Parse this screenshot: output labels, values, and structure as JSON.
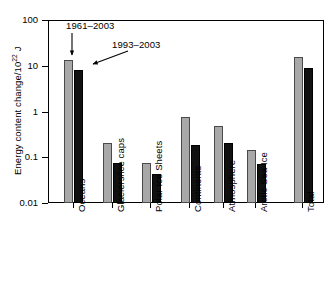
{
  "chart_data": {
    "type": "bar",
    "title": "",
    "xlabel": "",
    "ylabel": "Energy content change/10^22 J",
    "ylabel_parts": {
      "prefix": "Energy content change/10",
      "exponent": "22",
      "suffix": " J"
    },
    "scale": "log",
    "ylim": [
      0.01,
      100
    ],
    "ytick_labels": [
      "100",
      "10",
      "1",
      "0.1",
      "0.01"
    ],
    "ytick_values": [
      100,
      10,
      1,
      0.1,
      0.01
    ],
    "grid": false,
    "legend": "annotations",
    "categories": [
      "Oceans",
      "Glaciers/ice caps",
      "Polar Ice Sheets",
      "Continents",
      "Atmosphere",
      "Arctic Sea Ice",
      "Total"
    ],
    "series": [
      {
        "name": "1961-2003",
        "color": "#a8a8a8",
        "values": [
          14.2,
          0.22,
          0.08,
          0.8,
          0.5,
          0.15,
          16.0
        ]
      },
      {
        "name": "1993-2003",
        "color": "#111111",
        "values": [
          8.5,
          0.08,
          0.045,
          0.2,
          0.22,
          0.075,
          9.5
        ]
      }
    ],
    "annotations": [
      {
        "text": "1961–2003",
        "target_series": "1961-2003",
        "target_category": "Oceans"
      },
      {
        "text": "1993–2003",
        "target_series": "1993-2003",
        "target_category": "Oceans"
      }
    ]
  }
}
